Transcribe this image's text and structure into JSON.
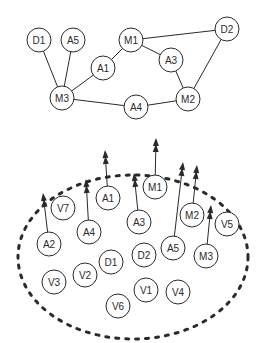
{
  "colors": {
    "stroke": "#2a2a2a",
    "background": "#ffffff",
    "node_fill": "#ffffff"
  },
  "top_graph": {
    "node_radius": 12,
    "nodes": [
      {
        "id": "D1",
        "label": "D1",
        "x": 39,
        "y": 40
      },
      {
        "id": "A5",
        "label": "A5",
        "x": 73,
        "y": 40
      },
      {
        "id": "M1",
        "label": "M1",
        "x": 131,
        "y": 40
      },
      {
        "id": "D2",
        "label": "D2",
        "x": 227,
        "y": 29
      },
      {
        "id": "A1",
        "label": "A1",
        "x": 103,
        "y": 68
      },
      {
        "id": "A3",
        "label": "A3",
        "x": 171,
        "y": 60
      },
      {
        "id": "M3",
        "label": "M3",
        "x": 62,
        "y": 98
      },
      {
        "id": "A4",
        "label": "A4",
        "x": 136,
        "y": 107
      },
      {
        "id": "M2",
        "label": "M2",
        "x": 188,
        "y": 99
      }
    ],
    "edges": [
      [
        "D1",
        "M3"
      ],
      [
        "A5",
        "M3"
      ],
      [
        "M3",
        "A1"
      ],
      [
        "A1",
        "M1"
      ],
      [
        "M1",
        "D2"
      ],
      [
        "M1",
        "A3"
      ],
      [
        "A3",
        "M2"
      ],
      [
        "D2",
        "M2"
      ],
      [
        "M3",
        "A4"
      ],
      [
        "A4",
        "M2"
      ]
    ]
  },
  "bottom_group": {
    "boundary": {
      "cx": 133,
      "cy": 257,
      "rx": 115,
      "ry": 82,
      "style": "dashed"
    },
    "node_radius": 12,
    "nodes": [
      {
        "id": "V7",
        "label": "V7",
        "x": 63,
        "y": 208
      },
      {
        "id": "A1",
        "label": "A1",
        "x": 108,
        "y": 198
      },
      {
        "id": "M1",
        "label": "M1",
        "x": 155,
        "y": 187
      },
      {
        "id": "A3",
        "label": "A3",
        "x": 139,
        "y": 222
      },
      {
        "id": "M2",
        "label": "M2",
        "x": 192,
        "y": 215
      },
      {
        "id": "V5",
        "label": "V5",
        "x": 227,
        "y": 224
      },
      {
        "id": "A2",
        "label": "A2",
        "x": 49,
        "y": 244
      },
      {
        "id": "A4",
        "label": "A4",
        "x": 89,
        "y": 232
      },
      {
        "id": "D1",
        "label": "D1",
        "x": 111,
        "y": 262
      },
      {
        "id": "D2",
        "label": "D2",
        "x": 144,
        "y": 255
      },
      {
        "id": "A5",
        "label": "A5",
        "x": 173,
        "y": 248
      },
      {
        "id": "M3",
        "label": "M3",
        "x": 206,
        "y": 256
      },
      {
        "id": "V3",
        "label": "V3",
        "x": 54,
        "y": 282
      },
      {
        "id": "V2",
        "label": "V2",
        "x": 85,
        "y": 275
      },
      {
        "id": "V1",
        "label": "V1",
        "x": 146,
        "y": 290
      },
      {
        "id": "V4",
        "label": "V4",
        "x": 178,
        "y": 292
      },
      {
        "id": "V6",
        "label": "V6",
        "x": 118,
        "y": 306
      }
    ],
    "arrows": [
      {
        "from": "A2",
        "tip_x": 43,
        "tip_y": 193
      },
      {
        "from": "A4",
        "tip_x": 86,
        "tip_y": 179
      },
      {
        "from": "A1",
        "tip_x": 105,
        "tip_y": 150
      },
      {
        "from": "A3",
        "tip_x": 134,
        "tip_y": 173
      },
      {
        "from": "M1",
        "tip_x": 156,
        "tip_y": 138
      },
      {
        "from": "A5",
        "tip_x": 183,
        "tip_y": 162
      },
      {
        "from": "M2",
        "tip_x": 197,
        "tip_y": 165
      },
      {
        "from": "M3",
        "tip_x": 211,
        "tip_y": 205
      }
    ],
    "arrowhead": "double"
  }
}
